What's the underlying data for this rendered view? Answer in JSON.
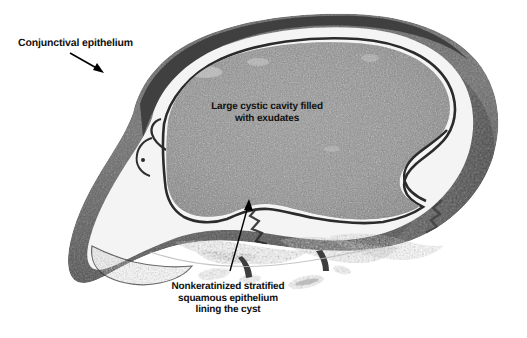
{
  "figure": {
    "type": "histopathology-micrograph",
    "background_color": "#ffffff",
    "width": 527,
    "height": 338
  },
  "palette": {
    "background": "#ffffff",
    "cavity_fill": "#8b8b8b",
    "cavity_fill_dark": "#6f6f6f",
    "wall_outer": "#595959",
    "wall_outer_dark": "#3d3d3d",
    "wall_mid": "#8d8d8d",
    "epithelium_line": "#2a2a2a",
    "clear_space": "#f2f2f2",
    "annotation_text": "#100f0d",
    "arrow": "#000000"
  },
  "annotations": [
    {
      "id": "conjunctival-epithelium",
      "text": "Conjunctival epithelium",
      "lines": [
        "Conjunctival epithelium"
      ],
      "align": "left",
      "x": 18,
      "y": 38,
      "font_size": 10.5,
      "arrow": {
        "from_x": 70,
        "from_y": 53,
        "to_x": 104,
        "to_y": 73
      }
    },
    {
      "id": "cystic-cavity",
      "text": "Large cystic cavity filled with exudates",
      "lines": [
        "Large cystic cavity filled",
        "with exudates"
      ],
      "align": "center",
      "x": 267,
      "y": 107,
      "font_size": 10,
      "arrow": null
    },
    {
      "id": "nonkeratinized-epithelium",
      "text": "Nonkeratinized stratified squamous epithelium lining the cyst",
      "lines": [
        "Nonkeratinized stratified",
        "squamous epithelium",
        "lining the cyst"
      ],
      "align": "center",
      "x": 228,
      "y": 287,
      "font_size": 10,
      "arrow": {
        "from_x": 230,
        "from_y": 272,
        "to_x": 249,
        "to_y": 200
      }
    }
  ],
  "structures": [
    {
      "id": "outer-capsule-wall",
      "label": "Outer fibrous capsule wall"
    },
    {
      "id": "clear-subepithelial-space",
      "label": "Clear subepithelial space"
    },
    {
      "id": "epithelial-lining",
      "label": "Nonkeratinized stratified squamous epithelial lining"
    },
    {
      "id": "cyst-lumen-exudate",
      "label": "Cyst lumen filled with granular exudate"
    },
    {
      "id": "basal-tissue-fragments",
      "label": "Irregular basal tissue fragments"
    }
  ]
}
